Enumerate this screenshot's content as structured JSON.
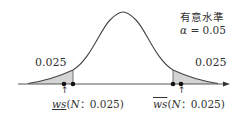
{
  "figure": {
    "type": "normal-distribution-two-tailed-test",
    "significance_heading": "有意水準",
    "alpha_symbol": "α",
    "alpha_equals": " = 0.05",
    "left_tail_area": "0.025",
    "right_tail_area": "0.025",
    "lower_critical": {
      "symbol": "ws",
      "decoration": "underline",
      "args_open": "(",
      "args_N": "N",
      "args_rest": "：0.025)"
    },
    "upper_critical": {
      "symbol": "ws",
      "decoration": "overline",
      "args_open": "(",
      "args_N": "N",
      "args_rest": "：0.025)"
    },
    "arrow_glyph": "↑",
    "colors": {
      "curve": "#444444",
      "shade": "#d0d0d0",
      "axis": "#444444",
      "dot": "#111111"
    }
  }
}
